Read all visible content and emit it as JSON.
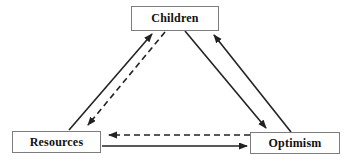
{
  "diagram": {
    "nodes": {
      "children": {
        "label": "Children"
      },
      "resources": {
        "label": "Resources"
      },
      "optimism": {
        "label": "Optimism"
      }
    },
    "edges": [
      {
        "from": "Resources",
        "to": "Children",
        "style": "solid"
      },
      {
        "from": "Children",
        "to": "Resources",
        "style": "dashed"
      },
      {
        "from": "Children",
        "to": "Optimism",
        "style": "solid"
      },
      {
        "from": "Optimism",
        "to": "Children",
        "style": "solid"
      },
      {
        "from": "Optimism",
        "to": "Resources",
        "style": "dashed"
      },
      {
        "from": "Resources",
        "to": "Optimism",
        "style": "solid"
      }
    ],
    "colors": {
      "line": "#222222",
      "box_border": "#7d7d7d",
      "text": "#111111",
      "background": "#ffffff"
    }
  }
}
